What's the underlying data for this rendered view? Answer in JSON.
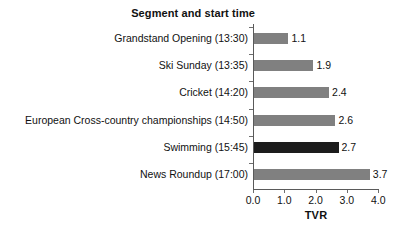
{
  "chart_data": {
    "type": "bar",
    "orientation": "horizontal",
    "title": "Segment and start time",
    "xlabel": "TVR",
    "ylabel": "",
    "xlim": [
      0.0,
      4.0
    ],
    "grid": false,
    "legend": null,
    "categories": [
      "Grandstand Opening (13:30)",
      "Ski Sunday (13:35)",
      "Cricket (14:20)",
      "European Cross-country championships (14:50)",
      "Swimming (15:45)",
      "News Roundup (17:00)"
    ],
    "values": [
      1.1,
      1.9,
      2.4,
      2.6,
      2.7,
      3.7
    ],
    "value_labels": [
      "1.1",
      "1.9",
      "2.4",
      "2.6",
      "2.7",
      "3.7"
    ],
    "highlighted_index": 4,
    "bar_colors": [
      "#808080",
      "#808080",
      "#808080",
      "#808080",
      "#1c1c1c",
      "#808080"
    ],
    "xticks": [
      0.0,
      1.0,
      2.0,
      3.0,
      4.0
    ],
    "xtick_labels": [
      "0.0",
      "1.0",
      "2.0",
      "3.0",
      "4.0"
    ],
    "colors": {
      "background": "#ffffff",
      "bar_default": "#808080",
      "bar_highlight": "#1c1c1c",
      "axis": "#5a5a5a",
      "text": "#111111"
    }
  }
}
